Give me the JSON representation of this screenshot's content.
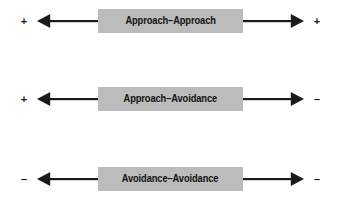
{
  "diagram": {
    "background_color": "#ffffff",
    "box_fill_color": "#bcbcbc",
    "line_color": "#1a1a1a",
    "text_color": "#111111",
    "rows": [
      {
        "label": "Approach–Approach",
        "left_valence": "+",
        "right_valence": "+",
        "left_arrow": "arrow-left",
        "right_arrow": "arrow-right"
      },
      {
        "label": "Approach–Avoidance",
        "left_valence": "+",
        "right_valence": "–",
        "left_arrow": "arrow-left",
        "right_arrow": "arrow-right"
      },
      {
        "label": "Avoidance–Avoidance",
        "left_valence": "–",
        "right_valence": "–",
        "left_arrow": "arrow-left",
        "right_arrow": "arrow-right"
      }
    ]
  }
}
